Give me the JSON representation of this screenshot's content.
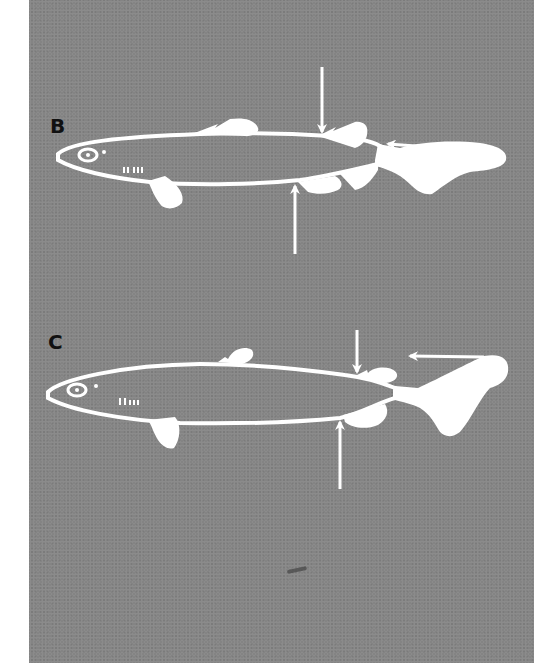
{
  "figure": {
    "background_color": "#848484",
    "foreground_color": "#ffffff",
    "label_color": "#111111",
    "panels": [
      {
        "label": "B",
        "subject": "shark silhouette, lateral view",
        "arrows": [
          "downward arrow above body (between first and second dorsal fin)",
          "upward arrow below body",
          "leftward arrow at upper caudal lobe"
        ]
      },
      {
        "label": "C",
        "subject": "shark silhouette, lateral view",
        "arrows": [
          "downward arrow above body (before second dorsal fin)",
          "upward arrow below body",
          "leftward arrow at upper caudal lobe"
        ]
      }
    ]
  }
}
